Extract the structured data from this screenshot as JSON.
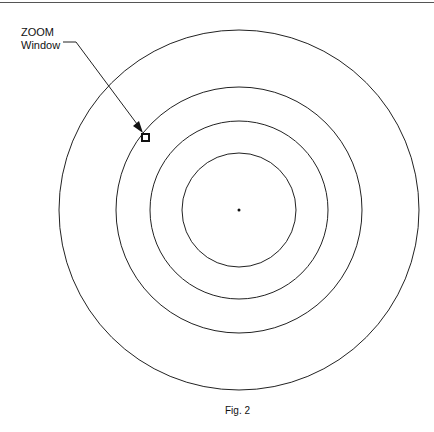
{
  "figure": {
    "callout_line1": "ZOOM",
    "callout_line2": "Window",
    "caption": "Fig. 2"
  },
  "geometry": {
    "center": [
      239,
      210
    ],
    "radii": [
      180,
      123,
      89,
      57
    ],
    "stroke_color": "#222222",
    "zoom_window_marker": [
      146,
      138
    ]
  }
}
